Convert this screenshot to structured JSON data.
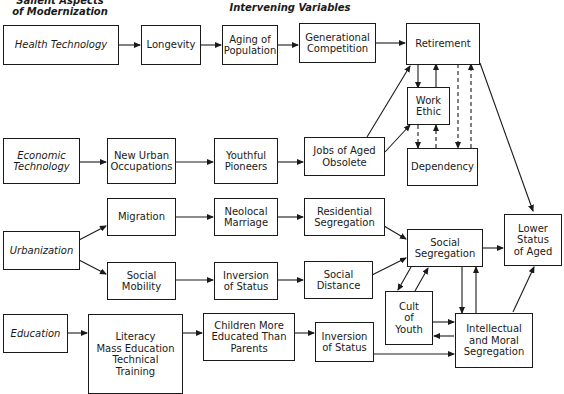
{
  "headers": {
    "salient": "Salient Aspects\nof Modernization",
    "intervening": "Intervening Variables"
  },
  "boxes": {
    "health_technology": "Health Technology",
    "longevity": "Longevity",
    "aging_of_population": "Aging of\nPopulation",
    "generational_competition": "Generational\nCompetition",
    "retirement": "Retirement",
    "work_ethic": "Work\nEthic",
    "dependency": "Dependency",
    "economic_technology": "Economic\nTechnology",
    "new_urban_occupations": "New Urban\nOccupations",
    "youthful_pioneers": "Youthful\nPioneers",
    "jobs_of_aged_obsolete": "Jobs of Aged\nObsolete",
    "urbanization": "Urbanization",
    "migration": "Migration",
    "neolocal_marriage": "Neolocal\nMarriage",
    "residential_segregation": "Residential\nSegregation",
    "social_mobility": "Social\nMobility",
    "inversion_of_status_1": "Inversion\nof Status",
    "social_distance": "Social\nDistance",
    "social_segregation": "Social\nSegregation",
    "lower_status_of_aged": "Lower\nStatus\nof Aged",
    "cult_of_youth": "Cult\nof\nYouth",
    "education": "Education",
    "literacy": "Literacy\nMass Education\nTechnical\nTraining",
    "children_more_educated": "Children More\nEducated Than\nParents",
    "inversion_of_status_2": "Inversion\nof Status",
    "intellectual_moral_segregation": "Intellectual\nand Moral\nSegregation"
  }
}
